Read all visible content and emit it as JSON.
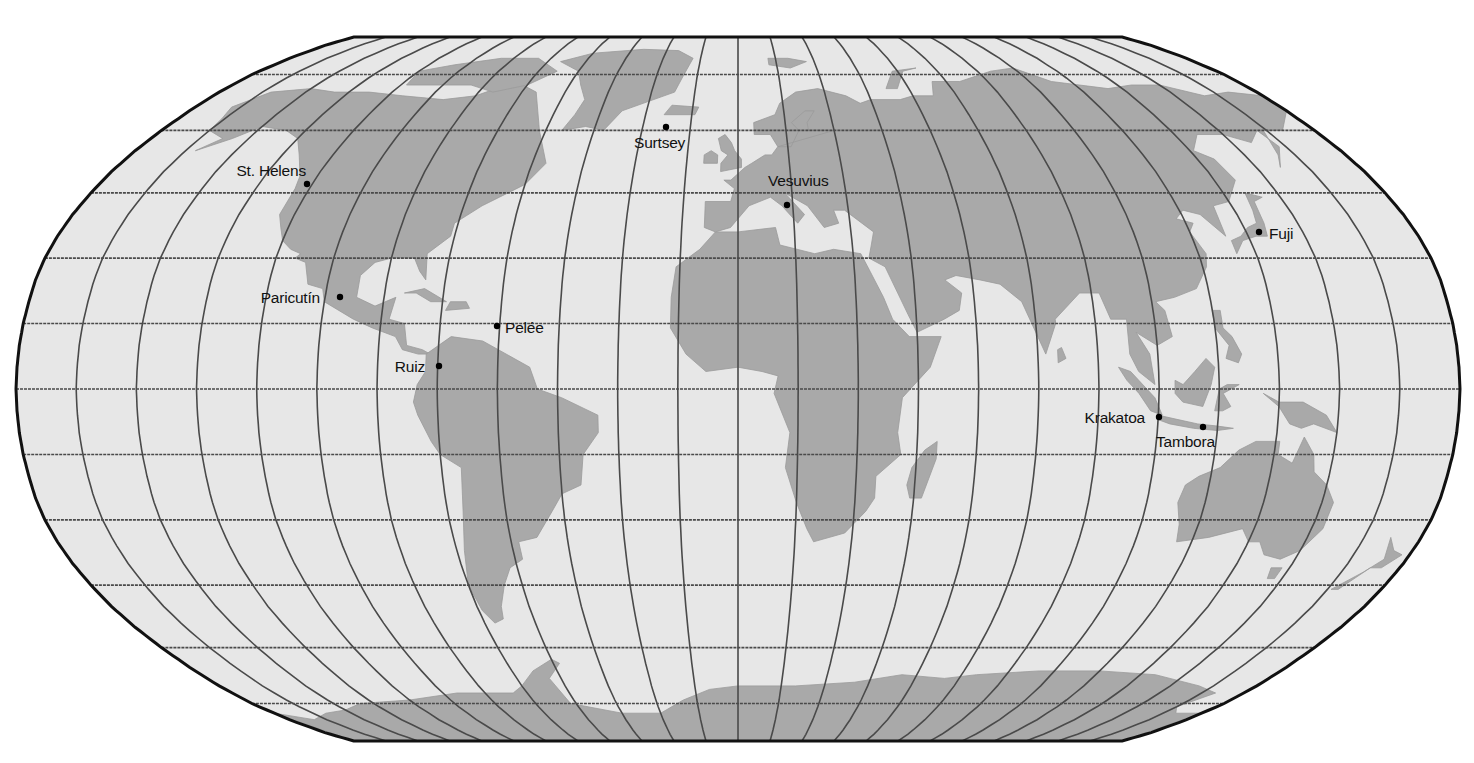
{
  "map": {
    "projection": "Robinson",
    "graticule_interval_deg": 15,
    "colors": {
      "ocean": "#e7e7e7",
      "land": "#a9a9a9",
      "grid": "#4a4a4a",
      "frame": "#111111",
      "marker": "#000000",
      "label": "#111111"
    },
    "volcanoes": [
      {
        "name": "St. Helens",
        "dot": [
          307,
          184
        ],
        "label_xy": [
          306,
          176
        ],
        "anchor": "end"
      },
      {
        "name": "Surtsey",
        "dot": [
          666,
          127
        ],
        "label_xy": [
          634,
          148
        ],
        "anchor": "start"
      },
      {
        "name": "Vesuvius",
        "dot": [
          787,
          205
        ],
        "label_xy": [
          768,
          186
        ],
        "anchor": "start"
      },
      {
        "name": "Fuji",
        "dot": [
          1259,
          232
        ],
        "label_xy": [
          1269,
          239
        ],
        "anchor": "start"
      },
      {
        "name": "Paricutín",
        "dot": [
          340,
          297
        ],
        "label_xy": [
          320,
          303
        ],
        "anchor": "end"
      },
      {
        "name": "Pelée",
        "dot": [
          497,
          326
        ],
        "label_xy": [
          505,
          333
        ],
        "anchor": "start"
      },
      {
        "name": "Ruiz",
        "dot": [
          439,
          366
        ],
        "label_xy": [
          425,
          372
        ],
        "anchor": "end"
      },
      {
        "name": "Krakatoa",
        "dot": [
          1159,
          417
        ],
        "label_xy": [
          1145,
          423
        ],
        "anchor": "end"
      },
      {
        "name": "Tambora",
        "dot": [
          1203,
          427
        ],
        "label_xy": [
          1156,
          447
        ],
        "anchor": "start"
      }
    ]
  }
}
